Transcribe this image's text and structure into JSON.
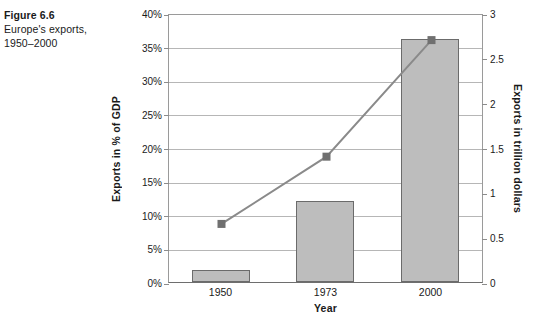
{
  "caption": {
    "title": "Figure 6.6",
    "subtitle_line1": "Europe's exports,",
    "subtitle_line2": "1950–2000"
  },
  "chart_data": {
    "type": "bar",
    "title": "",
    "subtitle": "",
    "categories": [
      "1950",
      "1973",
      "2000"
    ],
    "xlabel": "Year",
    "ylabel": "Exports in % of GDP",
    "y2label": "Exports in trillion dollars",
    "ylim": [
      0,
      40
    ],
    "y2lim": [
      0,
      3
    ],
    "grid": true,
    "legend": "none",
    "yticks": [
      "0%",
      "5%",
      "10%",
      "15%",
      "20%",
      "25%",
      "30%",
      "35%",
      "40%"
    ],
    "ytick_values": [
      0,
      5,
      10,
      15,
      20,
      25,
      30,
      35,
      40
    ],
    "y2ticks": [
      "0",
      "0.5",
      "1",
      "1.5",
      "2",
      "2.5",
      "3"
    ],
    "y2tick_values": [
      0,
      0.5,
      1,
      1.5,
      2,
      2.5,
      3
    ],
    "series": [
      {
        "name": "Exports in % of GDP",
        "kind": "bar",
        "axis": "left",
        "unit": "%",
        "color": "#bdbdbd",
        "edge_color": "#6b6b6b",
        "values": [
          1.8,
          12.0,
          36.2
        ]
      },
      {
        "name": "Exports in trillion dollars",
        "kind": "line",
        "axis": "right",
        "unit": "trillion dollars",
        "color": "#8a8a8a",
        "marker": "square",
        "marker_color": "#707070",
        "values": [
          0.67,
          1.42,
          2.72
        ]
      }
    ]
  }
}
